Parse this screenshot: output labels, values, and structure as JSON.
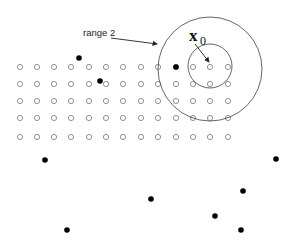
{
  "diagram": {
    "label_range": "range 2",
    "label_x": "x",
    "label_x_sub": "0",
    "colors": {
      "stroke": "#555555",
      "open_point_stroke": "#777777",
      "filled_point": "#000000"
    },
    "grid": {
      "columns_x": [
        20,
        37,
        54,
        71,
        89,
        106,
        123,
        141,
        158,
        176,
        193,
        210,
        228
      ],
      "rows_y": [
        67,
        84,
        101,
        118,
        137
      ],
      "point_radius": 2.6,
      "missing": []
    },
    "filled_points": [
      {
        "x": 79,
        "y": 58
      },
      {
        "x": 100,
        "y": 81
      },
      {
        "x": 176,
        "y": 67
      },
      {
        "x": 45,
        "y": 160
      },
      {
        "x": 276,
        "y": 159
      },
      {
        "x": 151,
        "y": 199
      },
      {
        "x": 243,
        "y": 191
      },
      {
        "x": 215,
        "y": 216
      },
      {
        "x": 67,
        "y": 230
      },
      {
        "x": 241,
        "y": 230
      }
    ],
    "outer_circle": {
      "cx": 210,
      "cy": 69,
      "r": 52
    },
    "inner_circle": {
      "cx": 210,
      "cy": 66,
      "r": 22
    },
    "arrow_range": {
      "x1": 111,
      "y1": 38,
      "x2": 157,
      "y2": 44
    },
    "arrow_x0": {
      "x1": 195,
      "y1": 44,
      "x2": 209,
      "y2": 62
    }
  }
}
